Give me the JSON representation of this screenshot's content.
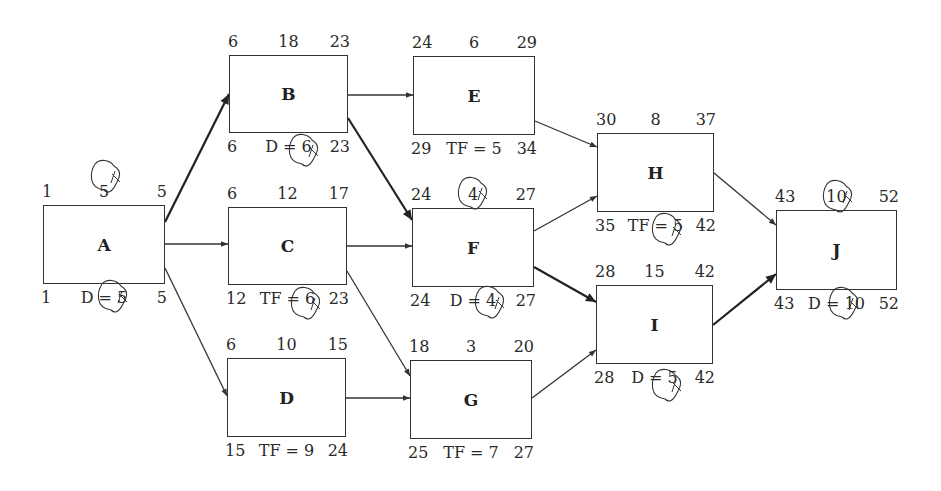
{
  "diagram": {
    "type": "activity-on-node network (CPM)",
    "nodes": [
      {
        "id": "A",
        "label": "A",
        "es": "1",
        "dur": "5",
        "ef": "5",
        "ls": "1",
        "bottom": "D = 5",
        "lf": "5",
        "critical": true,
        "box": [
          43,
          205,
          122,
          79
        ]
      },
      {
        "id": "B",
        "label": "B",
        "es": "6",
        "dur": "18",
        "ef": "23",
        "ls": "6",
        "bottom": "D = 6",
        "lf": "23",
        "critical": true,
        "box": [
          229,
          55,
          119,
          78
        ]
      },
      {
        "id": "C",
        "label": "C",
        "es": "6",
        "dur": "12",
        "ef": "17",
        "ls": "12",
        "bottom": "TF = 6",
        "lf": "23",
        "critical": false,
        "box": [
          228,
          207,
          119,
          78
        ]
      },
      {
        "id": "D",
        "label": "D",
        "es": "6",
        "dur": "10",
        "ef": "15",
        "ls": "15",
        "bottom": "TF = 9",
        "lf": "24",
        "critical": false,
        "box": [
          227,
          358,
          119,
          79
        ]
      },
      {
        "id": "E",
        "label": "E",
        "es": "24",
        "dur": "6",
        "ef": "29",
        "ls": "29",
        "bottom": "TF = 5",
        "lf": "34",
        "critical": false,
        "box": [
          413,
          56,
          122,
          79
        ]
      },
      {
        "id": "F",
        "label": "F",
        "es": "24",
        "dur": "4",
        "ef": "27",
        "ls": "24",
        "bottom": "D = 4",
        "lf": "27",
        "critical": true,
        "box": [
          412,
          208,
          122,
          79
        ]
      },
      {
        "id": "G",
        "label": "G",
        "es": "18",
        "dur": "3",
        "ef": "20",
        "ls": "25",
        "bottom": "TF = 7",
        "lf": "27",
        "critical": false,
        "box": [
          410,
          360,
          122,
          79
        ]
      },
      {
        "id": "H",
        "label": "H",
        "es": "30",
        "dur": "8",
        "ef": "37",
        "ls": "35",
        "bottom": "TF = 5",
        "lf": "42",
        "critical": false,
        "box": [
          597,
          133,
          117,
          79
        ]
      },
      {
        "id": "I",
        "label": "I",
        "es": "28",
        "dur": "15",
        "ef": "42",
        "ls": "28",
        "bottom": "D = 5",
        "lf": "42",
        "critical": true,
        "box": [
          596,
          285,
          117,
          79
        ]
      },
      {
        "id": "J",
        "label": "J",
        "es": "43",
        "dur": "10",
        "ef": "52",
        "ls": "43",
        "bottom": "D = 10",
        "lf": "52",
        "critical": true,
        "box": [
          776,
          210,
          121,
          80
        ]
      }
    ],
    "edges": [
      {
        "from": "A",
        "to": "B",
        "critical": true,
        "pts": [
          165,
          222,
          229,
          94
        ]
      },
      {
        "from": "A",
        "to": "C",
        "critical": false,
        "pts": [
          165,
          244,
          228,
          244
        ]
      },
      {
        "from": "A",
        "to": "D",
        "critical": false,
        "pts": [
          165,
          268,
          227,
          396
        ]
      },
      {
        "from": "B",
        "to": "E",
        "critical": false,
        "pts": [
          348,
          95,
          413,
          95
        ]
      },
      {
        "from": "B",
        "to": "F",
        "critical": true,
        "pts": [
          348,
          118,
          412,
          220
        ]
      },
      {
        "from": "C",
        "to": "F",
        "critical": false,
        "pts": [
          347,
          246,
          412,
          246
        ]
      },
      {
        "from": "C",
        "to": "G",
        "critical": false,
        "pts": [
          347,
          271,
          410,
          376
        ]
      },
      {
        "from": "D",
        "to": "G",
        "critical": false,
        "pts": [
          346,
          398,
          410,
          398
        ]
      },
      {
        "from": "E",
        "to": "H",
        "critical": false,
        "pts": [
          535,
          121,
          597,
          147
        ]
      },
      {
        "from": "F",
        "to": "H",
        "critical": false,
        "pts": [
          534,
          231,
          597,
          196
        ]
      },
      {
        "from": "F",
        "to": "I",
        "critical": true,
        "pts": [
          534,
          267,
          596,
          302
        ]
      },
      {
        "from": "G",
        "to": "I",
        "critical": false,
        "pts": [
          532,
          398,
          596,
          350
        ]
      },
      {
        "from": "H",
        "to": "J",
        "critical": false,
        "pts": [
          714,
          173,
          776,
          225
        ]
      },
      {
        "from": "I",
        "to": "J",
        "critical": true,
        "pts": [
          713,
          325,
          776,
          274
        ]
      }
    ],
    "scribble_circles": [
      {
        "node": "A",
        "where": "top-duration",
        "cx": 106,
        "cy": 176
      },
      {
        "node": "A",
        "where": "bottom",
        "cx": 113,
        "cy": 296
      },
      {
        "node": "B",
        "where": "bottom",
        "cx": 304,
        "cy": 150
      },
      {
        "node": "C",
        "where": "bottom",
        "cx": 306,
        "cy": 303
      },
      {
        "node": "F",
        "where": "top-duration",
        "cx": 473,
        "cy": 193
      },
      {
        "node": "F",
        "where": "bottom",
        "cx": 490,
        "cy": 302
      },
      {
        "node": "H",
        "where": "bottom",
        "cx": 667,
        "cy": 229
      },
      {
        "node": "I",
        "where": "bottom",
        "cx": 667,
        "cy": 385
      },
      {
        "node": "J",
        "where": "top-duration",
        "cx": 838,
        "cy": 196
      },
      {
        "node": "J",
        "where": "bottom",
        "cx": 844,
        "cy": 303
      }
    ],
    "colors": {
      "line": "#333333",
      "text": "#2a2a2a",
      "background": "#ffffff"
    }
  }
}
